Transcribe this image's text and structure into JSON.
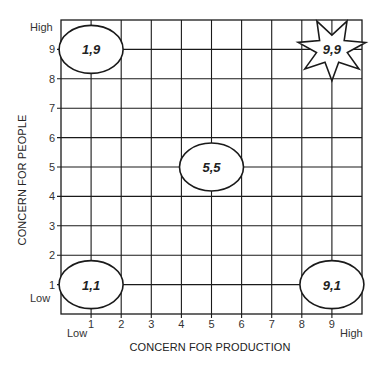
{
  "chart_data": {
    "type": "scatter",
    "title": "",
    "xlabel": "CONCERN FOR PRODUCTION",
    "ylabel": "CONCERN FOR PEOPLE",
    "xlim": [
      0,
      10
    ],
    "ylim": [
      0,
      10
    ],
    "grid": true,
    "x_ticks": [
      "1",
      "2",
      "3",
      "4",
      "5",
      "6",
      "7",
      "8",
      "9"
    ],
    "y_ticks": [
      "1",
      "2",
      "3",
      "4",
      "5",
      "6",
      "7",
      "8",
      "9"
    ],
    "x_end_labels": {
      "low": "Low",
      "high": "High"
    },
    "y_end_labels": {
      "low": "Low",
      "high": "High"
    },
    "points": [
      {
        "x": 1,
        "y": 9,
        "label": "1,9",
        "shape": "ellipse"
      },
      {
        "x": 9,
        "y": 9,
        "label": "9,9",
        "shape": "star"
      },
      {
        "x": 5,
        "y": 5,
        "label": "5,5",
        "shape": "ellipse"
      },
      {
        "x": 1,
        "y": 1,
        "label": "1,1",
        "shape": "ellipse"
      },
      {
        "x": 9,
        "y": 1,
        "label": "9,1",
        "shape": "ellipse"
      }
    ],
    "legend": null
  }
}
